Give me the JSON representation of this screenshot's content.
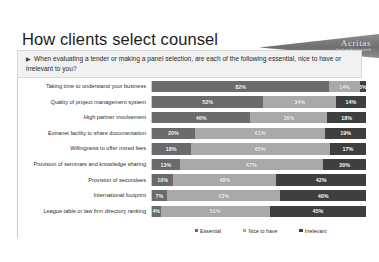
{
  "header": {
    "title": "How clients select counsel",
    "logo_name": "Acritas",
    "logo_tagline": "legal market research"
  },
  "question": {
    "bullet": "▶",
    "text": "When evaluating a tender or making a panel selection, are each of the following essential, nice to have or irrelevant to you?"
  },
  "chart_data": {
    "type": "bar",
    "orientation": "horizontal",
    "stacked": true,
    "stack_mode": "percent",
    "title": "How clients select counsel",
    "xlabel": "",
    "ylabel": "",
    "xlim": [
      0,
      100
    ],
    "grid": false,
    "legend_position": "bottom",
    "categories": [
      "Taking time to understand your business",
      "Quality of project management system",
      "High partner involvement",
      "Extranet facility to share documentation",
      "Willingness to offer mixed fees",
      "Provision of seminars and knowledge sharing",
      "Provision of secondees",
      "International footprint",
      "League table or law firm directory ranking"
    ],
    "series": [
      {
        "name": "Essential",
        "color": "#6b6b6b",
        "values": [
          82,
          52,
          46,
          20,
          18,
          13,
          10,
          7,
          4
        ],
        "labels": [
          "82%",
          "52%",
          "46%",
          "20%",
          "18%",
          "13%",
          "10%",
          "7%",
          "4%"
        ]
      },
      {
        "name": "Nice to have",
        "color": "#a9a9a9",
        "values": [
          14,
          34,
          36,
          61,
          65,
          67,
          48,
          53,
          51
        ],
        "labels": [
          "14%",
          "34%",
          "36%",
          "61%",
          "65%",
          "67%",
          "48%",
          "53%",
          "51%"
        ]
      },
      {
        "name": "Irrelevant",
        "color": "#3f3f3f",
        "values": [
          3,
          14,
          18,
          19,
          17,
          20,
          42,
          40,
          45
        ],
        "labels": [
          "3%",
          "14%",
          "18%",
          "19%",
          "17%",
          "20%",
          "42%",
          "40%",
          "45%"
        ]
      }
    ]
  }
}
